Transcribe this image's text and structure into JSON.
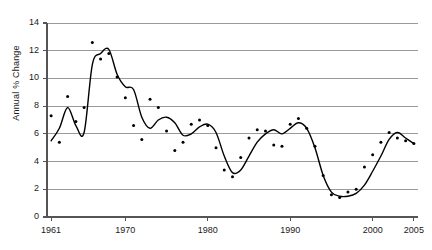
{
  "chart_data": {
    "type": "line",
    "title": "",
    "subtitle": "",
    "xlabel": "",
    "ylabel": "Annual % Change",
    "xlim": [
      1960.5,
      2005.5
    ],
    "ylim": [
      0,
      14
    ],
    "grid": true,
    "legend": "none",
    "y_ticks": [
      0,
      2,
      4,
      6,
      8,
      10,
      12,
      14
    ],
    "x_ticks": [
      1961,
      1970,
      1980,
      1990,
      2000,
      2005
    ],
    "x_tick_labels": [
      "1961",
      "1970",
      "1980",
      "1990",
      "2000",
      "2005"
    ],
    "y_tick_labels": [
      "0",
      "2",
      "4",
      "6",
      "8",
      "10",
      "12",
      "14"
    ],
    "colors": {
      "line": "#000000",
      "marker": "#000000",
      "grid": "#9a9a9a",
      "axis": "#555555",
      "background": "#ffffff",
      "text": "#1a1a1a"
    },
    "series": [
      {
        "name": "Annual observations",
        "type": "scatter",
        "marker": "dot",
        "x": [
          1961,
          1962,
          1963,
          1964,
          1965,
          1966,
          1967,
          1968,
          1969,
          1970,
          1971,
          1972,
          1973,
          1974,
          1975,
          1976,
          1977,
          1978,
          1979,
          1980,
          1981,
          1982,
          1983,
          1984,
          1985,
          1986,
          1987,
          1988,
          1989,
          1990,
          1991,
          1992,
          1993,
          1994,
          1995,
          1996,
          1997,
          1998,
          1999,
          2000,
          2001,
          2002,
          2003,
          2004,
          2005
        ],
        "values": [
          7.3,
          5.4,
          8.7,
          6.9,
          7.9,
          12.6,
          11.4,
          11.8,
          10.1,
          8.6,
          6.6,
          5.6,
          8.5,
          7.9,
          6.2,
          4.8,
          5.4,
          6.7,
          7.0,
          6.6,
          5.0,
          3.4,
          2.9,
          4.3,
          5.7,
          6.3,
          6.2,
          5.2,
          5.1,
          6.7,
          7.1,
          6.4,
          5.1,
          3.0,
          1.6,
          1.4,
          1.8,
          2.0,
          3.6,
          4.5,
          5.4,
          6.1,
          5.7,
          5.5,
          5.3
        ]
      },
      {
        "name": "Smoothed trend",
        "type": "line",
        "x": [
          1961,
          1962,
          1963,
          1964,
          1965,
          1966,
          1967,
          1968,
          1969,
          1970,
          1971,
          1972,
          1973,
          1974,
          1975,
          1976,
          1977,
          1978,
          1979,
          1980,
          1981,
          1982,
          1983,
          1984,
          1985,
          1986,
          1987,
          1988,
          1989,
          1990,
          1991,
          1992,
          1993,
          1994,
          1995,
          1996,
          1997,
          1998,
          1999,
          2000,
          2001,
          2002,
          2003,
          2004,
          2005
        ],
        "values": [
          5.5,
          6.4,
          7.9,
          6.6,
          6.1,
          11.0,
          11.8,
          12.1,
          10.3,
          9.4,
          9.2,
          7.2,
          6.4,
          7.0,
          7.2,
          6.8,
          5.9,
          6.0,
          6.5,
          6.7,
          6.1,
          4.4,
          3.2,
          3.4,
          4.4,
          5.4,
          6.0,
          6.3,
          6.0,
          6.4,
          6.8,
          6.4,
          5.0,
          3.0,
          1.8,
          1.5,
          1.5,
          1.7,
          2.3,
          3.3,
          4.4,
          5.6,
          6.1,
          5.7,
          5.3
        ]
      }
    ]
  },
  "axis_geometry": {
    "plot_left_px": 47,
    "plot_right_px": 418,
    "plot_top_px": 23,
    "plot_bottom_px": 217
  }
}
